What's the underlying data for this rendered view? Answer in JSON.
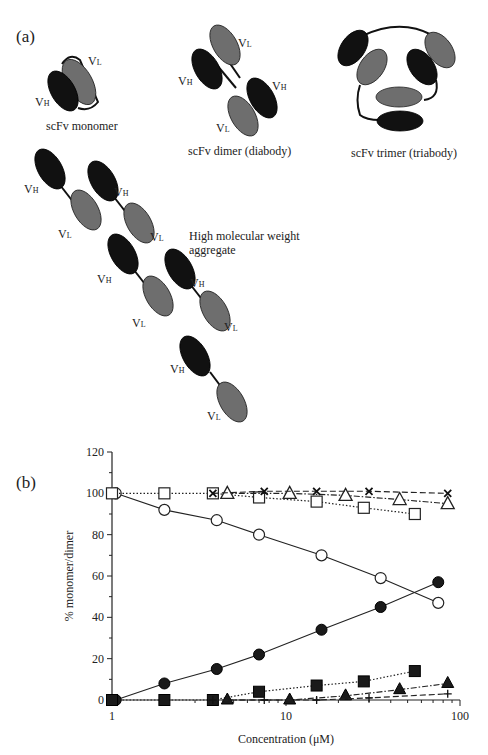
{
  "panel_a": {
    "label": "(a)",
    "domain_labels": {
      "heavy": "V",
      "heavy_sub": "H",
      "light": "V",
      "light_sub": "L"
    },
    "captions": {
      "monomer": "scFv monomer",
      "dimer": "scFv dimer (diabody)",
      "trimer": "scFv  trimer (triabody)",
      "aggregate_line1": "High molecular weight",
      "aggregate_line2": "aggregate"
    },
    "colors": {
      "heavy": "#111111",
      "light": "#6e6e6e"
    }
  },
  "panel_b": {
    "label": "(b)",
    "ylabel": "% monomer/dimer",
    "xlabel": "Concentration (μM)",
    "y_ticks": [
      "0",
      "20",
      "40",
      "60",
      "80",
      "100",
      "120"
    ],
    "x_ticks": [
      "1",
      "10",
      "100"
    ]
  },
  "chart_data": {
    "type": "line",
    "title": "",
    "xlabel": "Concentration (μM)",
    "ylabel": "% monomer/dimer",
    "xscale": "log",
    "xlim": [
      1,
      100
    ],
    "ylim": [
      0,
      120
    ],
    "y_ticks": [
      0,
      20,
      40,
      60,
      80,
      100,
      120
    ],
    "x_ticks": [
      1,
      10,
      100
    ],
    "grid": false,
    "legend": "none",
    "series": [
      {
        "name": "open circle (solid line)",
        "marker": "circle-open",
        "line": "solid",
        "x": [
          1.05,
          2.0,
          4.0,
          7.0,
          16,
          35,
          75
        ],
        "y": [
          100,
          92,
          87,
          80,
          70,
          59,
          47
        ]
      },
      {
        "name": "filled circle (solid line)",
        "marker": "circle-filled",
        "line": "solid",
        "x": [
          1.05,
          2.0,
          4.0,
          7.0,
          16,
          35,
          75
        ],
        "y": [
          0,
          8,
          15,
          22,
          34,
          45,
          57
        ]
      },
      {
        "name": "open square (dotted line)",
        "marker": "square-open",
        "line": "dotted",
        "x": [
          1.0,
          2.0,
          3.8,
          7.0,
          15,
          28,
          55
        ],
        "y": [
          100,
          100,
          100,
          98,
          96,
          93,
          90
        ]
      },
      {
        "name": "filled square (dotted line)",
        "marker": "square-filled",
        "line": "dotted",
        "x": [
          1.0,
          2.0,
          3.8,
          7.0,
          15,
          28,
          55
        ],
        "y": [
          0,
          0,
          0,
          4,
          7,
          9,
          14
        ]
      },
      {
        "name": "open triangle (dash-dot line)",
        "marker": "triangle-open",
        "line": "dashdot",
        "x": [
          4.6,
          10.5,
          22,
          45,
          85
        ],
        "y": [
          100,
          100,
          99,
          97,
          95
        ]
      },
      {
        "name": "filled triangle (dash-dot line)",
        "marker": "triangle-filled",
        "line": "dashdot",
        "x": [
          4.6,
          10.5,
          22,
          45,
          85
        ],
        "y": [
          0,
          0,
          2,
          5,
          8
        ]
      },
      {
        "name": "cross (dashed line)",
        "marker": "x",
        "line": "dashed",
        "x": [
          3.8,
          7.5,
          15,
          30,
          85
        ],
        "y": [
          100,
          101,
          101,
          101,
          100
        ]
      },
      {
        "name": "plus (dashed line)",
        "marker": "plus",
        "line": "dashed",
        "x": [
          3.8,
          7.5,
          15,
          30,
          85
        ],
        "y": [
          0,
          0,
          0,
          1,
          3
        ]
      }
    ]
  }
}
